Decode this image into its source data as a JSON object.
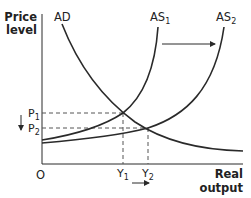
{
  "axes": {
    "y_label_line1": "Price",
    "y_label_line2": "level",
    "x_label_line1": "Real",
    "x_label_line2": "output",
    "origin": "O"
  },
  "curves": {
    "ad": "AD",
    "as1": {
      "base": "AS",
      "sub": "1"
    },
    "as2": {
      "base": "AS",
      "sub": "2"
    }
  },
  "levels": {
    "p1": {
      "base": "P",
      "sub": "1"
    },
    "p2": {
      "base": "P",
      "sub": "2"
    },
    "y1": {
      "base": "Y",
      "sub": "1"
    },
    "y2": {
      "base": "Y",
      "sub": "2"
    }
  },
  "colors": {
    "line": "#2a2a2a",
    "dash": "#555555",
    "text": "#222222"
  }
}
